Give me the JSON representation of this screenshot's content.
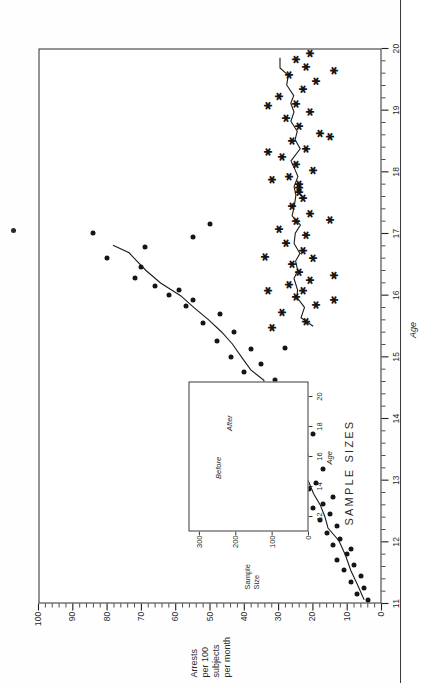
{
  "figure": {
    "axis_color": "#1f1f1f",
    "marker_color": "#151515",
    "frame_color": "#2b2b2b"
  },
  "chart_data": {
    "type": "scatter",
    "title": "",
    "xlabel": "Age",
    "ylabel": "Arrests per 100 subjects per month",
    "ylabel_lines": [
      "Arrests",
      "per 100",
      "subjects",
      "per month"
    ],
    "xlim": [
      11,
      20
    ],
    "ylim": [
      0,
      100
    ],
    "xticks": [
      11,
      12,
      13,
      14,
      15,
      16,
      17,
      18,
      19,
      20
    ],
    "xticklabels": [
      "11",
      "12",
      "13",
      "14",
      "15",
      "16",
      "17",
      "18",
      "19",
      "20"
    ],
    "yticks": [
      0,
      10,
      20,
      30,
      40,
      50,
      60,
      70,
      80,
      90,
      100
    ],
    "yticklabels": [
      "0",
      "10",
      "20",
      "30",
      "40",
      "50",
      "60",
      "70",
      "80",
      "90",
      "100"
    ],
    "minor_tick_interval_x": 0.2,
    "minor_tick_interval_y": 2,
    "grid": false,
    "legend": "none",
    "series": [
      {
        "name": "Before",
        "marker": "filled-circle",
        "points": [
          [
            11.05,
            4
          ],
          [
            11.15,
            7
          ],
          [
            11.25,
            5
          ],
          [
            11.35,
            9
          ],
          [
            11.45,
            6
          ],
          [
            11.55,
            11
          ],
          [
            11.62,
            8
          ],
          [
            11.7,
            13
          ],
          [
            11.8,
            10
          ],
          [
            11.88,
            9
          ],
          [
            11.95,
            14
          ],
          [
            12.05,
            12
          ],
          [
            12.15,
            16
          ],
          [
            12.25,
            13
          ],
          [
            12.35,
            18
          ],
          [
            12.45,
            15
          ],
          [
            12.55,
            20
          ],
          [
            12.62,
            17
          ],
          [
            12.72,
            14
          ],
          [
            12.85,
            21
          ],
          [
            12.95,
            19
          ],
          [
            13.05,
            23
          ],
          [
            13.18,
            17
          ],
          [
            13.3,
            25
          ],
          [
            13.4,
            22
          ],
          [
            13.52,
            28
          ],
          [
            13.62,
            24
          ],
          [
            13.75,
            20
          ],
          [
            13.88,
            30
          ],
          [
            14.0,
            27
          ],
          [
            14.12,
            33
          ],
          [
            14.25,
            29
          ],
          [
            14.38,
            26
          ],
          [
            14.5,
            36
          ],
          [
            14.62,
            31
          ],
          [
            14.75,
            40
          ],
          [
            14.88,
            35
          ],
          [
            15.0,
            44
          ],
          [
            15.12,
            38
          ],
          [
            15.25,
            48
          ],
          [
            15.4,
            43
          ],
          [
            15.55,
            52
          ],
          [
            15.7,
            47
          ],
          [
            15.82,
            57
          ],
          [
            15.92,
            55
          ],
          [
            16.0,
            62
          ],
          [
            16.08,
            59
          ],
          [
            16.15,
            66
          ],
          [
            16.28,
            72
          ],
          [
            16.45,
            70
          ],
          [
            16.6,
            80
          ],
          [
            16.78,
            69
          ],
          [
            17.0,
            84
          ],
          [
            16.95,
            55
          ],
          [
            17.15,
            50
          ],
          [
            15.15,
            28
          ],
          [
            14.4,
            52
          ],
          [
            13.95,
            43
          ],
          [
            12.4,
            26
          ]
        ]
      },
      {
        "name": "After",
        "marker": "asterisk",
        "points": [
          [
            15.55,
            23
          ],
          [
            15.7,
            30
          ],
          [
            15.82,
            20
          ],
          [
            15.95,
            26
          ],
          [
            16.05,
            24
          ],
          [
            16.15,
            28
          ],
          [
            16.22,
            22
          ],
          [
            16.35,
            25
          ],
          [
            16.48,
            27
          ],
          [
            16.58,
            21
          ],
          [
            16.7,
            24
          ],
          [
            16.82,
            29
          ],
          [
            16.95,
            23
          ],
          [
            17.05,
            31
          ],
          [
            17.18,
            26
          ],
          [
            17.3,
            22
          ],
          [
            17.42,
            27
          ],
          [
            17.55,
            24
          ],
          [
            17.65,
            25
          ],
          [
            17.72,
            25
          ],
          [
            17.78,
            25
          ],
          [
            17.9,
            28
          ],
          [
            18.0,
            21
          ],
          [
            18.1,
            26
          ],
          [
            18.22,
            30
          ],
          [
            18.35,
            23
          ],
          [
            18.48,
            27
          ],
          [
            18.6,
            19
          ],
          [
            18.72,
            25
          ],
          [
            18.85,
            29
          ],
          [
            18.95,
            22
          ],
          [
            19.08,
            26
          ],
          [
            19.2,
            31
          ],
          [
            19.32,
            24
          ],
          [
            19.45,
            20
          ],
          [
            19.55,
            28
          ],
          [
            19.68,
            23
          ],
          [
            19.8,
            26
          ],
          [
            19.9,
            22
          ],
          [
            16.6,
            35
          ],
          [
            16.05,
            34
          ],
          [
            15.45,
            33
          ],
          [
            17.85,
            33
          ],
          [
            18.3,
            34
          ],
          [
            19.05,
            34
          ],
          [
            16.3,
            15
          ],
          [
            17.2,
            16
          ],
          [
            18.55,
            16
          ],
          [
            19.62,
            15
          ],
          [
            15.9,
            15
          ]
        ]
      }
    ],
    "smooth_lines": [
      {
        "name": "Before trend",
        "points": [
          [
            11.05,
            5
          ],
          [
            11.3,
            7
          ],
          [
            11.55,
            9
          ],
          [
            11.8,
            11
          ],
          [
            12.0,
            13
          ],
          [
            12.2,
            15
          ],
          [
            12.4,
            17
          ],
          [
            12.6,
            18
          ],
          [
            12.8,
            20
          ],
          [
            13.0,
            22
          ],
          [
            13.2,
            24
          ],
          [
            13.4,
            24
          ],
          [
            13.6,
            26
          ],
          [
            13.8,
            28
          ],
          [
            14.0,
            29
          ],
          [
            14.2,
            31
          ],
          [
            14.4,
            34
          ],
          [
            14.6,
            34
          ],
          [
            14.8,
            38
          ],
          [
            15.0,
            41
          ],
          [
            15.2,
            43
          ],
          [
            15.4,
            47
          ],
          [
            15.6,
            51
          ],
          [
            15.8,
            55
          ],
          [
            16.0,
            59
          ],
          [
            16.2,
            64
          ],
          [
            16.4,
            69
          ],
          [
            16.55,
            72
          ],
          [
            16.7,
            74
          ],
          [
            16.82,
            78
          ]
        ]
      },
      {
        "name": "After trend",
        "points": [
          [
            15.5,
            20
          ],
          [
            15.65,
            24
          ],
          [
            15.8,
            22
          ],
          [
            15.95,
            25
          ],
          [
            16.1,
            24
          ],
          [
            16.25,
            26
          ],
          [
            16.4,
            24
          ],
          [
            16.55,
            25
          ],
          [
            16.7,
            24
          ],
          [
            16.85,
            26
          ],
          [
            17.0,
            25
          ],
          [
            17.15,
            24
          ],
          [
            17.3,
            26
          ],
          [
            17.45,
            25
          ],
          [
            17.6,
            25
          ],
          [
            17.75,
            25
          ],
          [
            17.9,
            24
          ],
          [
            18.05,
            25
          ],
          [
            18.2,
            26
          ],
          [
            18.35,
            24
          ],
          [
            18.5,
            25
          ],
          [
            18.65,
            24
          ],
          [
            18.8,
            26
          ],
          [
            18.95,
            25
          ],
          [
            19.1,
            27
          ],
          [
            19.25,
            26
          ],
          [
            19.4,
            28
          ],
          [
            19.55,
            27
          ],
          [
            19.7,
            29
          ],
          [
            19.85,
            30
          ]
        ]
      }
    ],
    "inset": {
      "title": "SAMPLE SIZES",
      "type": "line",
      "xlabel": "Age",
      "ylabel": "Sample Size",
      "ylabel_lines": [
        "Sample",
        "Size"
      ],
      "xlim": [
        11,
        21
      ],
      "ylim": [
        0,
        330
      ],
      "xticks": [
        12,
        14,
        16,
        18,
        20
      ],
      "xticklabels": [
        "12",
        "14",
        "16",
        "18",
        "20"
      ],
      "yticks": [
        0,
        100,
        200,
        300
      ],
      "yticklabels": [
        "0",
        "100",
        "200",
        "300"
      ],
      "series": [
        {
          "name": "Before",
          "values": [
            [
              11.3,
              310
            ],
            [
              12.0,
              300
            ],
            [
              13.0,
              298
            ],
            [
              14.5,
              250
            ],
            [
              16.0,
              190
            ],
            [
              17.5,
              120
            ],
            [
              19.0,
              70
            ],
            [
              20.3,
              45
            ]
          ]
        },
        {
          "name": "After",
          "values": [
            [
              14.5,
              40
            ],
            [
              15.3,
              60
            ],
            [
              16.0,
              100
            ],
            [
              17.0,
              160
            ],
            [
              17.6,
              195
            ],
            [
              18.5,
              165
            ],
            [
              19.4,
              110
            ],
            [
              20.3,
              55
            ]
          ]
        }
      ]
    }
  },
  "annotations": {
    "stray_mark": "ink-speck"
  }
}
